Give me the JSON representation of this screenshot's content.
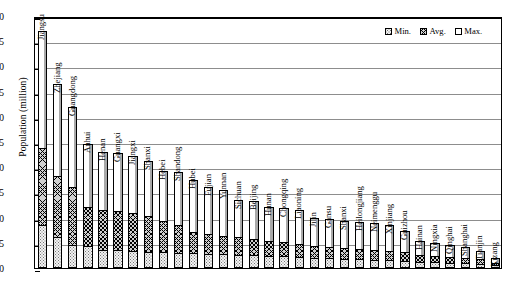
{
  "chart_data": {
    "type": "bar",
    "title": "",
    "xlabel": "",
    "ylabel": "Population (million)",
    "ylim": [
      0,
      50
    ],
    "ytick_labels": [
      "0",
      "5",
      "10",
      "15",
      "20",
      "25",
      "30",
      "35",
      "40",
      "45",
      "50"
    ],
    "ytick_values": [
      0,
      5,
      10,
      15,
      20,
      25,
      30,
      35,
      40,
      45,
      50
    ],
    "grid": true,
    "legend_position": "top-right",
    "legend": [
      "Min.",
      "Avg.",
      "Max."
    ],
    "stacked_style": "overlaid-levels",
    "categories": [
      "Jiangsu",
      "Zhejiang",
      "Guangdong",
      "Anhui",
      "Henan",
      "Guangxi",
      "Jiangxi",
      "Shanxi",
      "Hebei",
      "Shandong",
      "Hubei",
      "Fujian",
      "Yunnan",
      "Sichuan",
      "Beijing",
      "Hunan",
      "Chongqing",
      "Liaoning",
      "Jilin",
      "Gansu",
      "Shanxi",
      "Heilongjiang",
      "Neimenggu",
      "Xinjiang",
      "Guizhou",
      "Hainan",
      "Ningxia",
      "Qinghai",
      "Shanghai",
      "Tianjin",
      "Xizang"
    ],
    "series": [
      {
        "name": "Min.",
        "values": [
          8.6,
          6.1,
          4.6,
          4.3,
          3.6,
          3.6,
          3.4,
          3.2,
          3.1,
          3.0,
          2.9,
          2.8,
          2.7,
          2.6,
          2.5,
          2.4,
          2.3,
          2.2,
          2.0,
          1.9,
          1.8,
          1.7,
          1.6,
          1.5,
          1.4,
          1.2,
          1.1,
          1.0,
          0.9,
          0.8,
          0.5
        ]
      },
      {
        "name": "Avg.",
        "values": [
          23.8,
          18.3,
          16.0,
          12.2,
          11.5,
          11.3,
          11.0,
          10.4,
          9.3,
          8.6,
          7.1,
          6.8,
          6.4,
          6.1,
          5.8,
          5.4,
          5.1,
          4.8,
          4.4,
          4.2,
          4.0,
          3.8,
          3.6,
          3.4,
          3.2,
          2.6,
          2.4,
          2.2,
          2.0,
          1.7,
          1.0
        ]
      },
      {
        "name": "Max.",
        "values": [
          47.0,
          36.6,
          32.0,
          24.6,
          23.0,
          22.9,
          22.3,
          21.2,
          19.2,
          19.1,
          17.4,
          16.0,
          15.4,
          13.4,
          13.2,
          12.1,
          11.9,
          11.6,
          10.0,
          9.7,
          9.4,
          9.2,
          8.9,
          8.6,
          7.3,
          5.3,
          4.9,
          4.6,
          4.2,
          3.3,
          1.9
        ]
      }
    ]
  },
  "legend": {
    "min_label": "Min.",
    "avg_label": "Avg.",
    "max_label": "Max."
  },
  "axis": {
    "y_title": "Population (million)"
  }
}
